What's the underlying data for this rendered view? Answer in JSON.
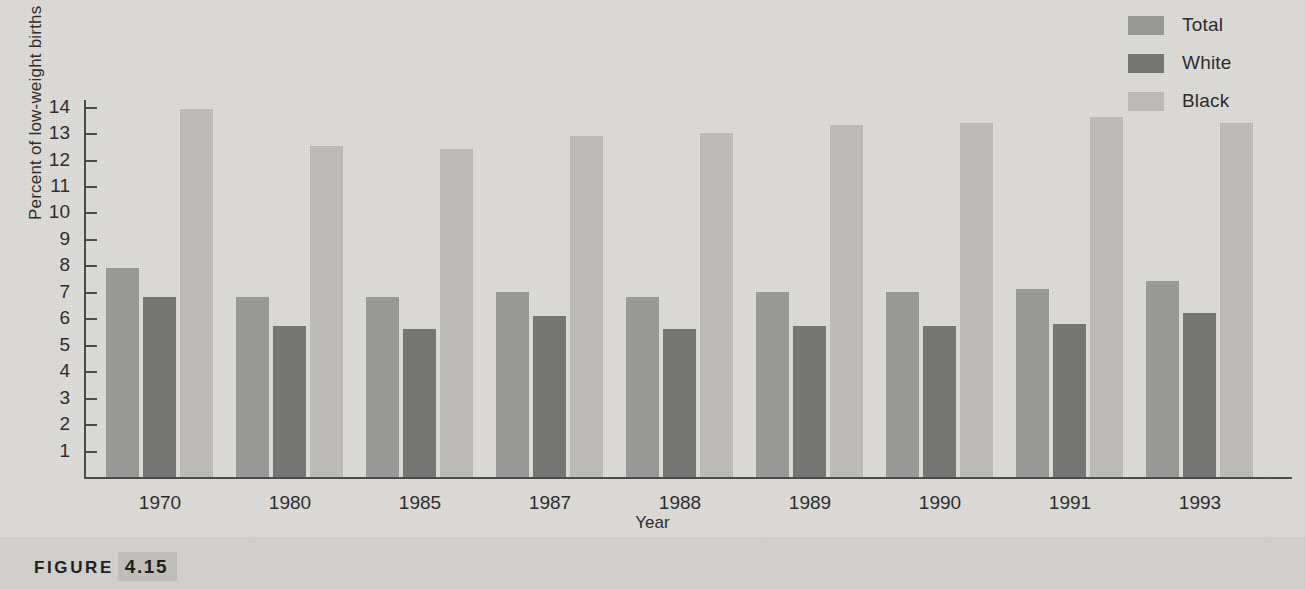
{
  "figure": {
    "caption_word": "FIGURE",
    "caption_number": "4.15"
  },
  "colors": {
    "background": "#dedcd8",
    "caption_band": "#d4d2ce",
    "axis": "#4a4a4a",
    "text": "#2b2b2b",
    "total": "#9a9a98",
    "white": "#757573",
    "black": "#bfbdb9"
  },
  "legend": {
    "position": "top-right",
    "entries": [
      {
        "label": "Total",
        "color": "#9a9a98"
      },
      {
        "label": "White",
        "color": "#757573"
      },
      {
        "label": "Black",
        "color": "#bfbdb9"
      }
    ]
  },
  "chart_data": {
    "type": "bar",
    "title": "",
    "xlabel": "Year",
    "ylabel": "Percent of low-weight births",
    "categories": [
      "1970",
      "1980",
      "1985",
      "1987",
      "1988",
      "1989",
      "1990",
      "1991",
      "1993"
    ],
    "series": [
      {
        "name": "Total",
        "color": "#9a9a98",
        "values": [
          7.9,
          6.8,
          6.8,
          7.0,
          6.8,
          7.0,
          7.0,
          7.1,
          7.4
        ]
      },
      {
        "name": "White",
        "color": "#757573",
        "values": [
          6.8,
          5.7,
          5.6,
          6.1,
          5.6,
          5.7,
          5.7,
          5.8,
          6.2
        ]
      },
      {
        "name": "Black",
        "color": "#bfbdb9",
        "values": [
          13.9,
          12.5,
          12.4,
          12.9,
          13.0,
          13.3,
          13.4,
          13.6,
          13.4
        ]
      }
    ],
    "ylim": [
      0,
      14.25
    ],
    "yticks": [
      1,
      2,
      3,
      4,
      5,
      6,
      7,
      8,
      9,
      10,
      11,
      12,
      13,
      14
    ],
    "ytick_labels": [
      "1",
      "2",
      "3",
      "4",
      "5",
      "6",
      "7",
      "8",
      "9",
      "10",
      "11",
      "12",
      "13",
      "14"
    ],
    "grid": false,
    "legend_position": "top-right"
  }
}
